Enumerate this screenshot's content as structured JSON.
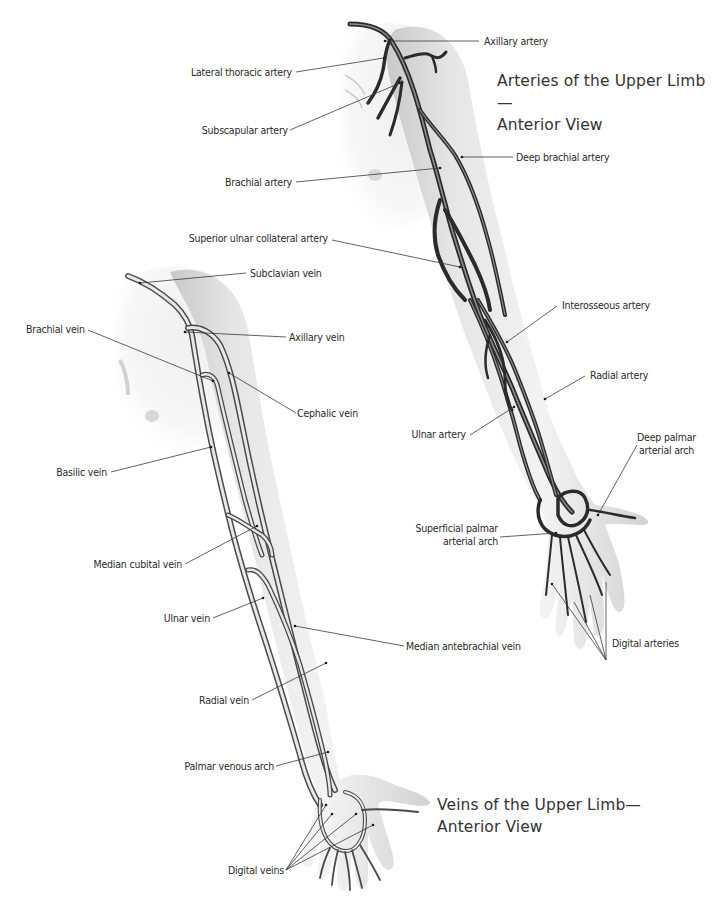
{
  "top_cut_text": "...",
  "arteries_diagram": {
    "title_line1": "Arteries of the Upper Limb—",
    "title_line2": "Anterior View",
    "labels": {
      "axillary_artery": "Axillary artery",
      "lateral_thoracic_artery": "Lateral thoracic artery",
      "subscapular_artery": "Subscapular artery",
      "deep_brachial_artery": "Deep brachial artery",
      "brachial_artery": "Brachial artery",
      "superior_ulnar_collateral_artery": "Superior ulnar collateral artery",
      "interosseous_artery": "Interosseous artery",
      "radial_artery": "Radial artery",
      "ulnar_artery": "Ulnar artery",
      "deep_palmar_arterial_arch_l1": "Deep palmar",
      "deep_palmar_arterial_arch_l2": "arterial arch",
      "superficial_palmar_arterial_arch_l1": "Superficial palmar",
      "superficial_palmar_arterial_arch_l2": "arterial arch",
      "digital_arteries": "Digital arteries"
    }
  },
  "veins_diagram": {
    "title_line1": "Veins of the Upper Limb—",
    "title_line2": "Anterior View",
    "labels": {
      "subclavian_vein": "Subclavian vein",
      "brachial_vein": "Brachial vein",
      "axillary_vein": "Axillary vein",
      "cephalic_vein": "Cephalic vein",
      "basilic_vein": "Basilic vein",
      "median_cubital_vein": "Median cubital vein",
      "ulnar_vein": "Ulnar vein",
      "median_antebrachial_vein": "Median antebrachial vein",
      "radial_vein": "Radial vein",
      "palmar_venous_arch": "Palmar venous arch",
      "digital_veins": "Digital veins"
    }
  },
  "colors": {
    "background": "#ffffff",
    "skin_light": "#f4f4f4",
    "skin_shadow": "#cfcfcf",
    "vessel_dark": "#2b2b2b",
    "label_text": "#2a2a2a",
    "title_text": "#333333"
  }
}
